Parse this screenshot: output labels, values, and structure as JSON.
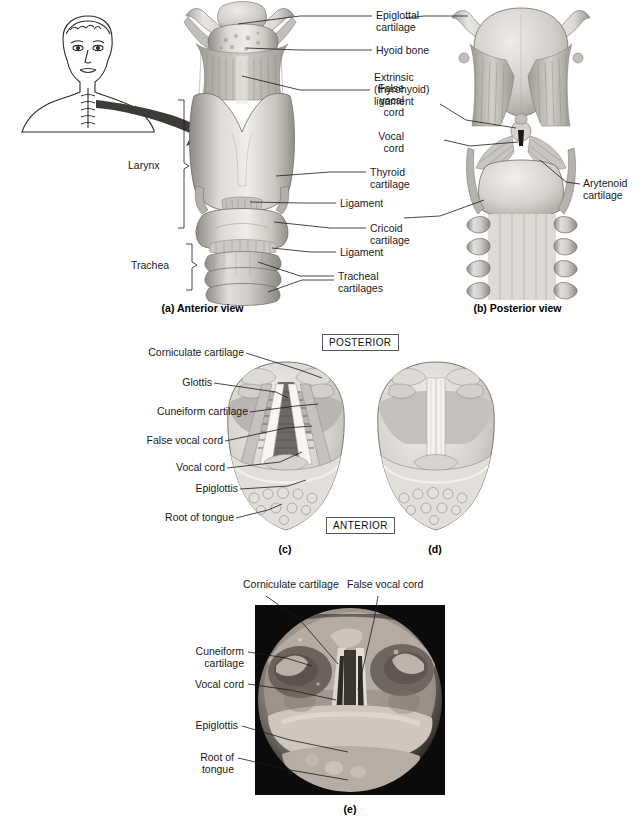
{
  "figure": {
    "panels": [
      {
        "id": "a",
        "caption": "(a) Anterior view"
      },
      {
        "id": "b",
        "caption": "(b) Posterior view"
      },
      {
        "id": "c",
        "caption": "(c)"
      },
      {
        "id": "d",
        "caption": "(d)"
      },
      {
        "id": "e",
        "caption": "(e)"
      }
    ]
  },
  "panel_a": {
    "caption": "(a) Anterior view",
    "labels": {
      "epiglottal_cartilage": "Epiglottal\ncartilage",
      "hyoid_bone": "Hyoid bone",
      "extrinsic_ligament": "Extrinsic\n(thyrohyoid)\nligament",
      "thyroid_cartilage": "Thyroid\ncartilage",
      "ligament_upper": "Ligament",
      "cricoid_cartilage": "Cricoid\ncartilage",
      "ligament_lower": "Ligament",
      "tracheal_cartilages": "Tracheal\ncartilages",
      "larynx": "Larynx",
      "trachea": "Trachea"
    }
  },
  "panel_b": {
    "caption": "(b) Posterior view",
    "labels": {
      "false_vocal_cord": "False\nvocal\ncord",
      "vocal_cord": "Vocal\ncord",
      "arytenoid_cartilage": "Arytenoid\ncartilage"
    }
  },
  "panel_cd": {
    "caption_c": "(c)",
    "caption_d": "(d)",
    "orientation_top": "POSTERIOR",
    "orientation_bottom": "ANTERIOR",
    "labels": {
      "corniculate_cartilage": "Corniculate cartilage",
      "glottis": "Glottis",
      "cuneiform_cartilage": "Cuneiform cartilage",
      "false_vocal_cord": "False vocal cord",
      "vocal_cord": "Vocal cord",
      "epiglottis": "Epiglottis",
      "root_of_tongue": "Root of tongue"
    }
  },
  "panel_e": {
    "caption": "(e)",
    "labels": {
      "corniculate_cartilage": "Corniculate cartilage",
      "false_vocal_cord": "False vocal cord",
      "cuneiform_cartilage": "Cuneiform\ncartilage",
      "vocal_cord": "Vocal cord",
      "epiglottis": "Epiglottis",
      "root_of_tongue": "Root of\ntongue"
    }
  },
  "inset": {
    "name": "head-and-neck-orientation-inset"
  },
  "colors": {
    "ink": "#1a1a1a",
    "cartilage_light": "#e6e4e0",
    "cartilage_mid": "#c8c5c0",
    "cartilage_dark": "#9b9893",
    "muscle": "#b9b5ae",
    "photo_frame": "#0b0b0b",
    "white": "#ffffff"
  }
}
